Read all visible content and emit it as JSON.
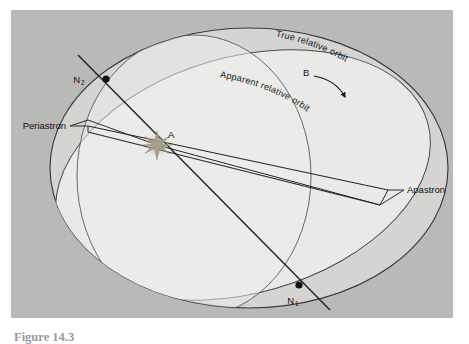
{
  "figure": {
    "caption": "Figure 14.3",
    "panel": {
      "background_color": "#b9b9b7",
      "fill_true_orbit": "#d4d4d2",
      "fill_apparent_orbit": "#e9e9e7",
      "stroke_color": "#3a3a3a"
    },
    "labels": {
      "true_orbit": "True relative orbit",
      "apparent_orbit": "Apparent relative orbit",
      "secondary_star": "B",
      "primary_star": "A",
      "periastron": "Periastron",
      "apastron": "Apastron",
      "node_ascending": "N",
      "node_ascending_sub": "1",
      "node_descending": "N",
      "node_descending_sub": "2"
    },
    "markers": {
      "primary_star_symbol": "star-glyph",
      "node_symbol": "filled-dot",
      "direction_arrow": "curved-arrow"
    },
    "points": {
      "primary_star_A": [
        157,
        145
      ],
      "node_N1": [
        299,
        285
      ],
      "node_N2": [
        106,
        79
      ],
      "periastron_point": [
        88,
        126
      ],
      "apastron_point": [
        388,
        190
      ]
    }
  }
}
